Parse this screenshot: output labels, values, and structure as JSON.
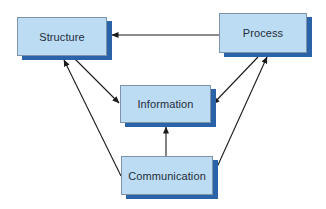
{
  "diagram": {
    "colors": {
      "box_fill": "#bcdcf3",
      "box_border": "#7d93a8",
      "box_shadow": "#2b63a8",
      "arrow": "#1a1a1a",
      "text": "#1f2d3a",
      "background": "#ffffff"
    },
    "nodes": {
      "structure": {
        "label": "Structure"
      },
      "process": {
        "label": "Process"
      },
      "information": {
        "label": "Information"
      },
      "communication": {
        "label": "Communication"
      }
    },
    "edges": [
      {
        "from": "Process",
        "to": "Structure"
      },
      {
        "from": "Structure",
        "to": "Information"
      },
      {
        "from": "Communication",
        "to": "Structure"
      },
      {
        "from": "Process",
        "to": "Information"
      },
      {
        "from": "Communication",
        "to": "Process"
      },
      {
        "from": "Communication",
        "to": "Information"
      }
    ]
  }
}
